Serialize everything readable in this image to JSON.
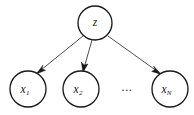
{
  "figure": {
    "kind": "directed-graphical-model",
    "background_color": "#ffffff",
    "stroke_color": "#1a1a1a",
    "edge_color": "#3a3a3a"
  },
  "nodes": {
    "latent": {
      "id": "z",
      "label": "z",
      "subscript": "",
      "cx": 95,
      "cy": 23,
      "r": 17
    },
    "observed": [
      {
        "id": "x1",
        "label": "x",
        "subscript": "1",
        "cx": 28,
        "cy": 89,
        "r": 18
      },
      {
        "id": "x2",
        "label": "x",
        "subscript": "2",
        "cx": 81,
        "cy": 89,
        "r": 18
      },
      {
        "id": "xN",
        "label": "x",
        "subscript": "N",
        "cx": 170,
        "cy": 89,
        "r": 18
      }
    ]
  },
  "ellipsis": {
    "text": "...",
    "cx": 127,
    "cy": 91
  },
  "edges": [
    {
      "id": "z-to-x1",
      "from": "z",
      "to": "x1",
      "x1": 83,
      "y1": 36,
      "x2": 37,
      "y2": 73
    },
    {
      "id": "z-to-x2",
      "from": "z",
      "to": "x2",
      "x1": 92,
      "y1": 40,
      "x2": 83,
      "y2": 71
    },
    {
      "id": "z-to-xN",
      "from": "z",
      "to": "xN",
      "x1": 108,
      "y1": 36,
      "x2": 160,
      "y2": 74
    }
  ]
}
